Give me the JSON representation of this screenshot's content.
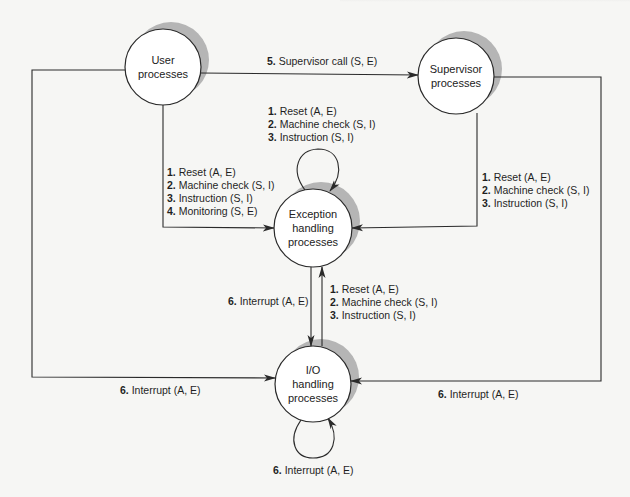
{
  "nodes": {
    "user": {
      "line1": "User",
      "line2": "processes"
    },
    "supervisor": {
      "line1": "Supervisor",
      "line2": "processes"
    },
    "exception": {
      "line1": "Exception",
      "line2": "handling",
      "line3": "processes"
    },
    "io": {
      "line1": "I/O",
      "line2": "handling",
      "line3": "processes"
    }
  },
  "edges": {
    "user_to_supervisor": {
      "num": "5.",
      "text": " Supervisor call (S, E)"
    },
    "exception_self": [
      {
        "num": "1.",
        "text": " Reset (A, E)"
      },
      {
        "num": "2.",
        "text": " Machine check (S, I)"
      },
      {
        "num": "3.",
        "text": " Instruction (S, I)"
      }
    ],
    "user_to_exception": [
      {
        "num": "1.",
        "text": " Reset (A, E)"
      },
      {
        "num": "2.",
        "text": " Machine check (S, I)"
      },
      {
        "num": "3.",
        "text": " Instruction (S, I)"
      },
      {
        "num": "4.",
        "text": " Monitoring (S, E)"
      }
    ],
    "supervisor_to_exception": [
      {
        "num": "1.",
        "text": " Reset (A, E)"
      },
      {
        "num": "2.",
        "text": " Machine check (S, I)"
      },
      {
        "num": "3.",
        "text": " Instruction (S, I)"
      }
    ],
    "exception_to_io": {
      "num": "6.",
      "text": " Interrupt (A, E)"
    },
    "io_to_exception": [
      {
        "num": "1.",
        "text": " Reset (A, E)"
      },
      {
        "num": "2.",
        "text": " Machine check (S, I)"
      },
      {
        "num": "3.",
        "text": " Instruction (S, I)"
      }
    ],
    "user_to_io": {
      "num": "6.",
      "text": " Interrupt (A, E)"
    },
    "supervisor_to_io": {
      "num": "6.",
      "text": " Interrupt (A, E)"
    },
    "io_self": {
      "num": "6.",
      "text": " Interrupt (A, E)"
    }
  },
  "colors": {
    "line": "#2a2a2a",
    "shadow": "#b5b5b5",
    "node_fill": "#ffffff",
    "background": "#f6f6f4"
  }
}
